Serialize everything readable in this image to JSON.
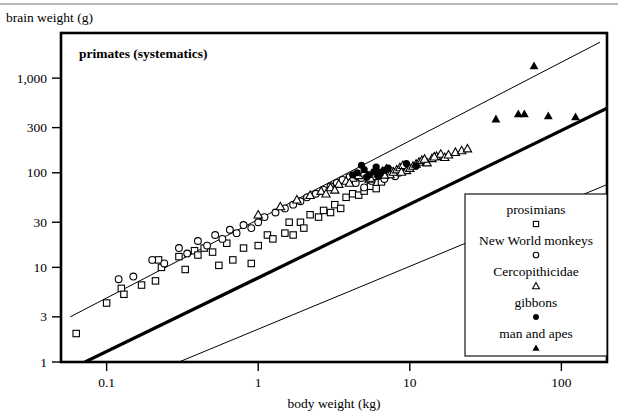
{
  "chart_data": {
    "type": "scatter",
    "title": "primates (systematics)",
    "xlabel": "body weight (kg)",
    "ylabel": "brain weight (g)",
    "xscale": "log",
    "yscale": "log",
    "xlim": [
      0.05,
      200
    ],
    "ylim": [
      1,
      3000
    ],
    "xticks": [
      0.1,
      1,
      10,
      100
    ],
    "xticklabels": [
      "0.1",
      "1",
      "10",
      "100"
    ],
    "yticks": [
      1,
      3,
      10,
      30,
      100,
      300,
      1000
    ],
    "yticklabels": [
      "1",
      "3",
      "10",
      "30",
      "100",
      "300",
      "1,000"
    ],
    "grid": false,
    "legend_position": "lower-right",
    "legend": [
      {
        "label": "prosimians",
        "marker": "open-square"
      },
      {
        "label": "New World monkeys",
        "marker": "open-circle"
      },
      {
        "label": "Cercopithicidae",
        "marker": "open-triangle"
      },
      {
        "label": "gibbons",
        "marker": "filled-circle"
      },
      {
        "label": "man and apes",
        "marker": "filled-triangle"
      }
    ],
    "lines": [
      {
        "name": "upper-confidence-line",
        "weight": "thin",
        "points": [
          [
            0.0575,
            3.0
          ],
          [
            180,
            2400
          ]
        ]
      },
      {
        "name": "regression-line",
        "weight": "thick",
        "points": [
          [
            0.072,
            1.0
          ],
          [
            200,
            480
          ]
        ]
      },
      {
        "name": "lower-confidence-line",
        "weight": "thin",
        "points": [
          [
            0.3,
            1.0
          ],
          [
            200,
            75
          ]
        ]
      }
    ],
    "series": [
      {
        "name": "prosimians",
        "marker": "open-square",
        "points": [
          [
            0.063,
            2.0
          ],
          [
            0.1,
            4.2
          ],
          [
            0.125,
            6.0
          ],
          [
            0.13,
            5.2
          ],
          [
            0.17,
            6.5
          ],
          [
            0.21,
            7.2
          ],
          [
            0.22,
            12.0
          ],
          [
            0.23,
            10.0
          ],
          [
            0.3,
            13.0
          ],
          [
            0.33,
            9.5
          ],
          [
            0.38,
            15.0
          ],
          [
            0.4,
            13.5
          ],
          [
            0.44,
            16.0
          ],
          [
            0.5,
            14.5
          ],
          [
            0.55,
            10.5
          ],
          [
            0.62,
            18.0
          ],
          [
            0.68,
            12.0
          ],
          [
            0.8,
            16.0
          ],
          [
            0.9,
            11.0
          ],
          [
            1.0,
            17.0
          ],
          [
            1.15,
            22.0
          ],
          [
            1.25,
            20.0
          ],
          [
            1.5,
            23.0
          ],
          [
            1.6,
            30.0
          ],
          [
            1.7,
            22.0
          ],
          [
            1.9,
            30.0
          ],
          [
            2.0,
            26.0
          ],
          [
            2.2,
            36.0
          ],
          [
            2.5,
            34.0
          ],
          [
            2.7,
            40.0
          ],
          [
            3.0,
            38.0
          ],
          [
            3.2,
            46.0
          ],
          [
            3.5,
            42.0
          ],
          [
            3.8,
            55.0
          ],
          [
            4.2,
            60.0
          ],
          [
            4.6,
            58.0
          ],
          [
            5.0,
            64.0
          ],
          [
            5.5,
            72.0
          ],
          [
            6.0,
            68.0
          ],
          [
            6.5,
            80.0
          ]
        ]
      },
      {
        "name": "New World monkeys",
        "marker": "open-circle",
        "points": [
          [
            0.12,
            7.5
          ],
          [
            0.15,
            8.0
          ],
          [
            0.2,
            12.0
          ],
          [
            0.24,
            11.0
          ],
          [
            0.3,
            16.0
          ],
          [
            0.34,
            14.0
          ],
          [
            0.4,
            19.0
          ],
          [
            0.46,
            17.0
          ],
          [
            0.52,
            22.0
          ],
          [
            0.58,
            20.0
          ],
          [
            0.65,
            25.0
          ],
          [
            0.72,
            23.0
          ],
          [
            0.8,
            28.0
          ],
          [
            0.9,
            26.0
          ],
          [
            1.0,
            30.0
          ],
          [
            1.1,
            34.0
          ],
          [
            1.3,
            38.0
          ],
          [
            1.5,
            42.0
          ],
          [
            1.7,
            46.0
          ],
          [
            1.9,
            50.0
          ],
          [
            2.1,
            55.0
          ],
          [
            2.4,
            60.0
          ],
          [
            2.7,
            66.0
          ],
          [
            3.0,
            72.0
          ],
          [
            3.3,
            78.0
          ],
          [
            3.6,
            84.0
          ],
          [
            4.0,
            90.0
          ],
          [
            4.4,
            78.0
          ],
          [
            4.8,
            88.0
          ],
          [
            5.2,
            95.0
          ],
          [
            5.6,
            82.0
          ],
          [
            6.0,
            92.0
          ],
          [
            6.4,
            100.0
          ],
          [
            6.8,
            86.0
          ],
          [
            7.2,
            96.0
          ],
          [
            7.6,
            104.0
          ],
          [
            8.0,
            92.0
          ],
          [
            8.5,
            100.0
          ],
          [
            9.0,
            110.0
          ],
          [
            5.0,
            70.0
          ]
        ]
      },
      {
        "name": "Cercopithicidae",
        "marker": "open-triangle",
        "points": [
          [
            1.0,
            36.0
          ],
          [
            1.4,
            44.0
          ],
          [
            1.8,
            52.0
          ],
          [
            2.2,
            58.0
          ],
          [
            2.6,
            64.0
          ],
          [
            3.0,
            70.0
          ],
          [
            3.4,
            76.0
          ],
          [
            3.8,
            82.0
          ],
          [
            4.2,
            88.0
          ],
          [
            4.6,
            94.0
          ],
          [
            5.0,
            100.0
          ],
          [
            5.4,
            86.0
          ],
          [
            5.8,
            92.0
          ],
          [
            6.2,
            98.0
          ],
          [
            6.6,
            104.0
          ],
          [
            7.0,
            110.0
          ],
          [
            7.4,
            96.0
          ],
          [
            7.8,
            102.0
          ],
          [
            8.2,
            108.0
          ],
          [
            8.6,
            114.0
          ],
          [
            9.0,
            120.0
          ],
          [
            9.5,
            106.0
          ],
          [
            10.0,
            112.0
          ],
          [
            10.5,
            118.0
          ],
          [
            11.0,
            124.0
          ],
          [
            11.5,
            130.0
          ],
          [
            12.0,
            136.0
          ],
          [
            13.0,
            128.0
          ],
          [
            14.0,
            142.0
          ],
          [
            15.0,
            150.0
          ],
          [
            16.0,
            158.0
          ],
          [
            17.0,
            146.0
          ],
          [
            18.0,
            155.0
          ],
          [
            20.0,
            165.0
          ],
          [
            22.0,
            172.0
          ],
          [
            24.0,
            180.0
          ],
          [
            4.0,
            78.0
          ],
          [
            5.5,
            88.0
          ],
          [
            6.8,
            95.0
          ],
          [
            8.8,
            102.0
          ],
          [
            3.2,
            66.0
          ],
          [
            2.8,
            60.0
          ],
          [
            12.5,
            140.0
          ],
          [
            14.5,
            148.0
          ]
        ]
      },
      {
        "name": "gibbons",
        "marker": "filled-circle",
        "points": [
          [
            4.5,
            100.0
          ],
          [
            5.0,
            108.0
          ],
          [
            5.4,
            95.0
          ],
          [
            5.8,
            102.0
          ],
          [
            6.0,
            115.0
          ],
          [
            6.4,
            98.0
          ],
          [
            6.8,
            106.0
          ],
          [
            7.2,
            112.0
          ],
          [
            4.8,
            120.0
          ],
          [
            5.2,
            90.0
          ],
          [
            9.5,
            125.0
          ],
          [
            11.0,
            118.0
          ],
          [
            4.2,
            95.0
          ],
          [
            6.2,
            92.0
          ]
        ]
      },
      {
        "name": "man and apes",
        "marker": "filled-triangle",
        "points": [
          [
            37.0,
            370.0
          ],
          [
            52.0,
            420.0
          ],
          [
            57.0,
            420.0
          ],
          [
            82.0,
            400.0
          ],
          [
            124.0,
            390.0
          ],
          [
            66.0,
            1350.0
          ]
        ]
      }
    ]
  }
}
